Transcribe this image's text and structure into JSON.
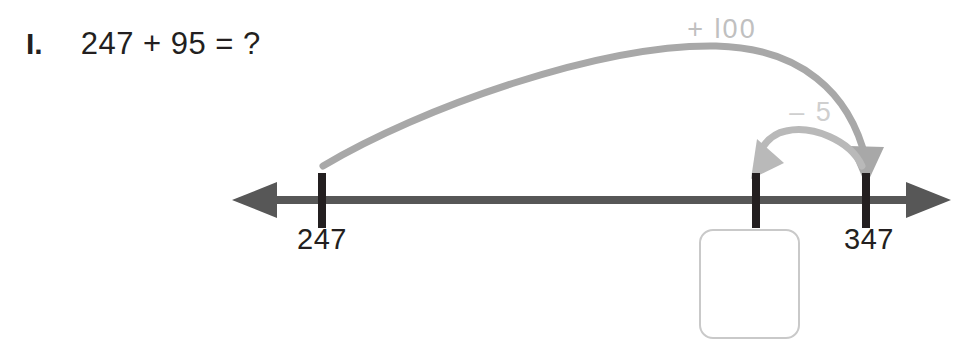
{
  "worksheet": {
    "problem_number": "I.",
    "expression": "247 + 95 = ?"
  },
  "number_line": {
    "axis_color": "#575757",
    "tick_color": "#231f20",
    "left_arrow_icon": "arrow-left-icon",
    "right_arrow_icon": "arrow-right-icon",
    "ticks": [
      {
        "label": "247",
        "x": 322
      },
      {
        "label": "",
        "x": 756
      },
      {
        "label": "347",
        "x": 866
      }
    ]
  },
  "jumps": [
    {
      "label": "+ l00",
      "value": "+100",
      "color": "#a8a8a8",
      "label_color": "#c0c0c0",
      "from": "247",
      "to": "347",
      "direction": "right"
    },
    {
      "label": "– 5",
      "value": "-5",
      "color": "#b9b9b9",
      "label_color": "#cfcfcf",
      "from": "347",
      "to": "342",
      "direction": "left"
    }
  ],
  "answer_box": {
    "value": "",
    "placeholder": "",
    "border_color": "#c9c9c9"
  }
}
